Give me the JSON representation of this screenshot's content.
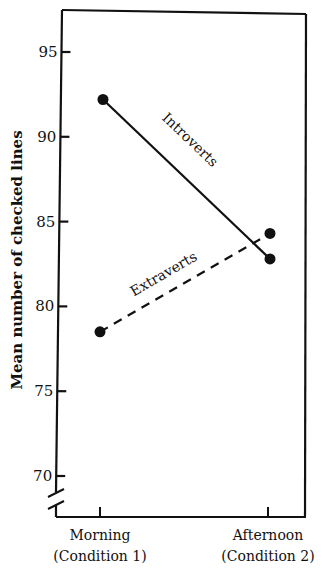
{
  "chart_data": {
    "type": "line",
    "title": "",
    "xlabel": "",
    "ylabel": "Mean number of checked lines",
    "categories": [
      {
        "line1": "Morning",
        "line2": "(Condition 1)"
      },
      {
        "line1": "Afternoon",
        "line2": "(Condition 2)"
      }
    ],
    "y_ticks": [
      70,
      75,
      80,
      85,
      90,
      95
    ],
    "ylim": [
      68,
      97.5
    ],
    "y_axis_break": true,
    "grid": false,
    "legend": "inline labels along lines",
    "series": [
      {
        "name": "Introverts",
        "style": "solid",
        "values": [
          92.2,
          82.8
        ]
      },
      {
        "name": "Extraverts",
        "style": "dashed",
        "values": [
          78.5,
          84.3
        ]
      }
    ]
  },
  "colors": {
    "ink": "#111111",
    "background": "#ffffff"
  }
}
